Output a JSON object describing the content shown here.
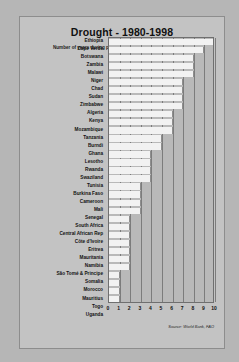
{
  "chart": {
    "title": "Drought - 1980-1998",
    "subtitle": "Number of years during period",
    "source": "Source: World Bank, FAO"
  },
  "chart_data": {
    "type": "bar",
    "orientation": "horizontal",
    "title": "Drought - 1980-1998",
    "xlabel": "Number of years during period",
    "ylabel": "",
    "xlim": [
      0,
      10
    ],
    "grid": true,
    "legend": "none",
    "xticks": [
      0,
      1,
      2,
      3,
      4,
      5,
      6,
      7,
      8,
      9,
      10
    ],
    "categories": [
      "Ethiopia",
      "Cape Verde",
      "Botswana",
      "Zambia",
      "Malawi",
      "Niger",
      "Chad",
      "Sudan",
      "Zimbabwe",
      "Algeria",
      "Kenya",
      "Mozambique",
      "Tanzania",
      "Burndi",
      "Ghana",
      "Lesotho",
      "Rwanda",
      "Swaziland",
      "Tunisia",
      "Burkina Faso",
      "Cameroon",
      "Mali",
      "Senegal",
      "South Africa",
      "Central African Rep",
      "Côte d'Ivoire",
      "Eritrea",
      "Mauritania",
      "Namibia",
      "São Tomé & Principe",
      "Somalia",
      "Morocco",
      "Mauritius",
      "Togo",
      "Uganda"
    ],
    "values": [
      10,
      9,
      8,
      8,
      8,
      7,
      7,
      7,
      7,
      6,
      6,
      6,
      5,
      5,
      4,
      4,
      4,
      4,
      3,
      3,
      3,
      3,
      2,
      2,
      2,
      2,
      2,
      2,
      2,
      1,
      1,
      1,
      1,
      1,
      1
    ]
  }
}
